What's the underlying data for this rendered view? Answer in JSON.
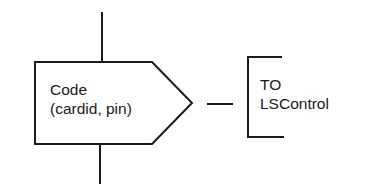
{
  "diagram": {
    "process": {
      "line1": "Code",
      "line2": "(cardid, pin)"
    },
    "destination": {
      "line1": "TO",
      "line2": "LSControl"
    },
    "colors": {
      "stroke": "#1a1a1a",
      "background": "#ffffff",
      "text": "#1a1a1a"
    }
  }
}
